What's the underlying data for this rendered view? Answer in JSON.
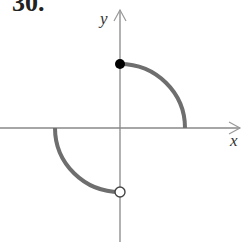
{
  "problem": {
    "number": "30."
  },
  "axes": {
    "x_label": "x",
    "y_label": "y",
    "origin": [
      120,
      128
    ],
    "x_range_px": [
      0,
      240
    ],
    "y_range_px": [
      10,
      242
    ],
    "axis_color": "#888888"
  },
  "curve": {
    "color": "#6e6e6e",
    "stroke_width": 4,
    "pieces": [
      {
        "description": "quarter circle in quadrant I from (0,r) to (r,0)",
        "start_px": [
          120,
          64
        ],
        "end_px": [
          185,
          128
        ],
        "radius_px": 64
      },
      {
        "description": "quarter circle in quadrant III from (-r,0) to (0,-r)",
        "start_px": [
          55,
          128
        ],
        "end_px": [
          120,
          192
        ],
        "radius_px": 64
      }
    ]
  },
  "points": [
    {
      "type": "closed",
      "px": [
        120,
        64
      ],
      "fill": "#000000"
    },
    {
      "type": "open",
      "px": [
        120,
        192
      ],
      "fill": "#ffffff"
    }
  ]
}
